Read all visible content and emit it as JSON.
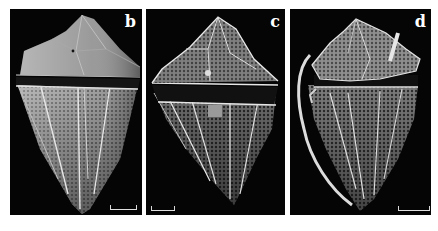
{
  "figure": {
    "panels": [
      {
        "id": "b",
        "label": "b",
        "scale_bar_position": "bottom-right"
      },
      {
        "id": "c",
        "label": "c",
        "scale_bar_position": "bottom-left"
      },
      {
        "id": "d",
        "label": "d",
        "scale_bar_position": "bottom-right"
      }
    ],
    "colors": {
      "background": "#050505",
      "specimen_light": "#d6d6d6",
      "specimen_mid": "#8a8a8a",
      "specimen_dark": "#3a3a3a",
      "page": "#ffffff"
    }
  }
}
